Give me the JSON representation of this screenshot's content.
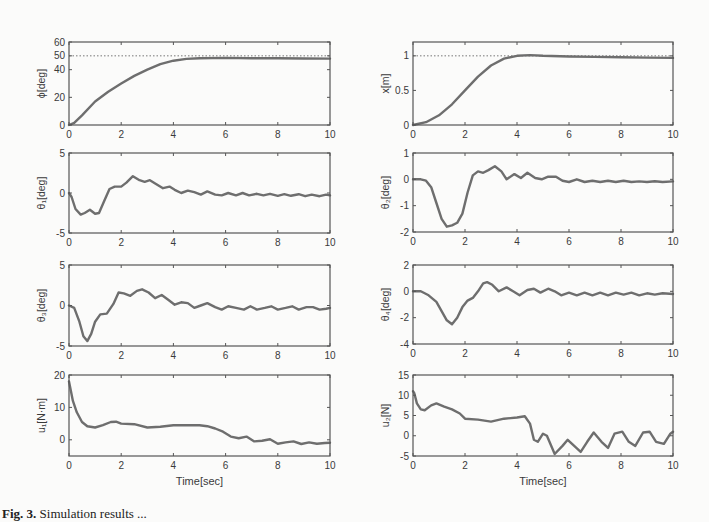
{
  "caption": {
    "label": "Fig. 3.",
    "text": "Simulation results ..."
  },
  "style": {
    "line_color": "#6e6e6e",
    "axis_color": "#555555",
    "ref_color": "#777777",
    "background": "#fbfbfa"
  },
  "chart_data": [
    {
      "id": "phi",
      "type": "line",
      "ylabel": "ϕ[deg]",
      "xlabel": "",
      "xlim": [
        0,
        10
      ],
      "ylim": [
        0,
        60
      ],
      "xticks": [
        0,
        2,
        4,
        6,
        8,
        10
      ],
      "yticks": [
        0,
        20,
        40,
        50,
        60
      ],
      "reference": 50,
      "x": [
        0,
        0.2,
        0.5,
        1,
        1.5,
        2,
        2.5,
        3,
        3.5,
        4,
        4.5,
        5,
        6,
        7,
        8,
        9,
        10
      ],
      "values": [
        0,
        1.5,
        7,
        17,
        24,
        30,
        35.5,
        40,
        44,
        46.5,
        47.8,
        48.3,
        48.5,
        48.3,
        48.2,
        48.1,
        48.0
      ]
    },
    {
      "id": "x",
      "type": "line",
      "ylabel": "x[m]",
      "xlabel": "",
      "xlim": [
        0,
        10
      ],
      "ylim": [
        0,
        1.2
      ],
      "xticks": [
        0,
        2,
        4,
        6,
        8,
        10
      ],
      "yticks": [
        0,
        0.5,
        1
      ],
      "reference": 1,
      "x": [
        0,
        0.5,
        1,
        1.5,
        2,
        2.5,
        3,
        3.5,
        4,
        4.5,
        5,
        6,
        7,
        8,
        9,
        10
      ],
      "values": [
        0,
        0.04,
        0.14,
        0.3,
        0.5,
        0.7,
        0.86,
        0.96,
        1.0,
        1.01,
        1.0,
        0.99,
        0.985,
        0.98,
        0.975,
        0.97
      ]
    },
    {
      "id": "theta1",
      "type": "line",
      "ylabel": "θ₁[deg]",
      "xlabel": "",
      "xlim": [
        0,
        10
      ],
      "ylim": [
        -5,
        5
      ],
      "xticks": [
        0,
        2,
        4,
        6,
        8,
        10
      ],
      "yticks": [
        -5,
        0,
        5
      ],
      "x": [
        0,
        0.1,
        0.25,
        0.45,
        0.6,
        0.8,
        1.0,
        1.15,
        1.35,
        1.55,
        1.75,
        2.0,
        2.2,
        2.45,
        2.7,
        2.9,
        3.1,
        3.35,
        3.6,
        3.85,
        4.05,
        4.3,
        4.55,
        4.8,
        5.05,
        5.3,
        5.6,
        5.85,
        6.1,
        6.4,
        6.65,
        6.9,
        7.2,
        7.45,
        7.7,
        8.0,
        8.25,
        8.5,
        8.8,
        9.05,
        9.3,
        9.6,
        9.85,
        10
      ],
      "values": [
        0,
        -0.5,
        -2.0,
        -2.7,
        -2.5,
        -2.1,
        -2.6,
        -2.5,
        -1.0,
        0.5,
        0.8,
        0.8,
        1.3,
        2.1,
        1.6,
        1.4,
        1.6,
        1.1,
        0.6,
        0.8,
        0.4,
        0.0,
        0.3,
        0.1,
        -0.2,
        0.2,
        -0.2,
        -0.3,
        0.0,
        -0.3,
        0.0,
        -0.3,
        -0.1,
        -0.3,
        -0.1,
        -0.35,
        -0.15,
        -0.35,
        -0.15,
        -0.4,
        -0.2,
        -0.4,
        -0.2,
        -0.3
      ]
    },
    {
      "id": "theta2",
      "type": "line",
      "ylabel": "θ₂[deg]",
      "xlabel": "",
      "xlim": [
        0,
        10
      ],
      "ylim": [
        -2,
        1
      ],
      "xticks": [
        0,
        2,
        4,
        6,
        8,
        10
      ],
      "yticks": [
        -2,
        -1,
        0,
        1
      ],
      "x": [
        0,
        0.3,
        0.5,
        0.7,
        0.9,
        1.1,
        1.3,
        1.5,
        1.7,
        1.9,
        2.1,
        2.3,
        2.5,
        2.7,
        2.9,
        3.15,
        3.4,
        3.6,
        3.9,
        4.15,
        4.4,
        4.7,
        4.95,
        5.2,
        5.5,
        5.75,
        6.0,
        6.3,
        6.6,
        6.9,
        7.2,
        7.5,
        7.8,
        8.1,
        8.4,
        8.7,
        9.0,
        9.3,
        9.6,
        10
      ],
      "values": [
        0,
        0,
        -0.05,
        -0.3,
        -0.9,
        -1.5,
        -1.8,
        -1.75,
        -1.65,
        -1.3,
        -0.5,
        0.15,
        0.3,
        0.25,
        0.35,
        0.5,
        0.3,
        0.0,
        0.2,
        0.05,
        0.25,
        0.05,
        0.0,
        0.1,
        0.1,
        -0.05,
        -0.1,
        0.0,
        -0.1,
        -0.05,
        -0.1,
        -0.05,
        -0.1,
        -0.05,
        -0.1,
        -0.08,
        -0.1,
        -0.07,
        -0.1,
        -0.08
      ]
    },
    {
      "id": "theta3",
      "type": "line",
      "ylabel": "θ₃[deg]",
      "xlabel": "",
      "xlim": [
        0,
        10
      ],
      "ylim": [
        -5,
        5
      ],
      "xticks": [
        0,
        2,
        4,
        6,
        8,
        10
      ],
      "yticks": [
        -5,
        0,
        5
      ],
      "x": [
        0,
        0.2,
        0.4,
        0.55,
        0.7,
        0.85,
        1.0,
        1.2,
        1.45,
        1.7,
        1.9,
        2.1,
        2.35,
        2.6,
        2.8,
        3.05,
        3.3,
        3.55,
        3.8,
        4.05,
        4.3,
        4.55,
        4.8,
        5.05,
        5.3,
        5.6,
        5.85,
        6.1,
        6.4,
        6.7,
        6.95,
        7.2,
        7.5,
        7.75,
        8.0,
        8.3,
        8.55,
        8.8,
        9.1,
        9.35,
        9.6,
        9.85,
        10
      ],
      "values": [
        0,
        -0.3,
        -2.0,
        -3.8,
        -4.4,
        -3.5,
        -2.0,
        -1.1,
        -1.0,
        0.2,
        1.6,
        1.5,
        1.2,
        1.8,
        2.0,
        1.6,
        0.9,
        1.3,
        0.7,
        0.1,
        0.4,
        0.3,
        -0.3,
        0.0,
        0.3,
        -0.2,
        -0.5,
        -0.1,
        -0.3,
        -0.5,
        -0.1,
        -0.5,
        -0.3,
        -0.1,
        -0.5,
        -0.3,
        -0.1,
        -0.5,
        -0.2,
        -0.2,
        -0.5,
        -0.4,
        -0.3
      ]
    },
    {
      "id": "theta4",
      "type": "line",
      "ylabel": "θ₄[deg]",
      "xlabel": "",
      "xlim": [
        0,
        10
      ],
      "ylim": [
        -4,
        2
      ],
      "xticks": [
        0,
        2,
        4,
        6,
        8,
        10
      ],
      "yticks": [
        -4,
        -2,
        0,
        2
      ],
      "x": [
        0,
        0.3,
        0.6,
        0.9,
        1.1,
        1.3,
        1.5,
        1.7,
        1.9,
        2.1,
        2.3,
        2.5,
        2.7,
        2.85,
        3.05,
        3.3,
        3.6,
        3.85,
        4.1,
        4.4,
        4.65,
        4.9,
        5.2,
        5.45,
        5.7,
        6.0,
        6.3,
        6.6,
        6.9,
        7.2,
        7.5,
        7.8,
        8.1,
        8.4,
        8.7,
        9.0,
        9.3,
        9.6,
        10
      ],
      "values": [
        0,
        0,
        -0.3,
        -0.8,
        -1.5,
        -2.2,
        -2.5,
        -2.0,
        -1.2,
        -0.7,
        -0.5,
        0.0,
        0.6,
        0.7,
        0.5,
        0.0,
        0.3,
        0.0,
        -0.3,
        0.1,
        0.2,
        -0.1,
        0.2,
        0.0,
        -0.3,
        -0.1,
        -0.3,
        -0.1,
        -0.3,
        -0.1,
        -0.3,
        -0.1,
        -0.25,
        -0.1,
        -0.3,
        -0.15,
        -0.25,
        -0.15,
        -0.2
      ]
    },
    {
      "id": "u1",
      "type": "line",
      "ylabel": "u₁[N·m]",
      "xlabel": "Time[sec]",
      "xlim": [
        0,
        10
      ],
      "ylim": [
        -5,
        20
      ],
      "xticks": [
        0,
        2,
        4,
        6,
        8,
        10
      ],
      "yticks": [
        0,
        10,
        20
      ],
      "x": [
        0,
        0.05,
        0.15,
        0.3,
        0.5,
        0.7,
        1.0,
        1.3,
        1.6,
        1.8,
        2.0,
        2.5,
        3.0,
        3.5,
        4.0,
        4.5,
        5.0,
        5.3,
        5.6,
        5.9,
        6.2,
        6.5,
        6.8,
        7.1,
        7.4,
        7.7,
        8.0,
        8.3,
        8.6,
        8.9,
        9.2,
        9.5,
        9.8,
        10
      ],
      "values": [
        18,
        16,
        12,
        8.5,
        5.5,
        4.2,
        3.8,
        4.5,
        5.5,
        5.6,
        5.0,
        4.8,
        3.8,
        4.0,
        4.5,
        4.5,
        4.5,
        4.2,
        3.5,
        2.5,
        1.0,
        0.5,
        1.0,
        -0.5,
        -0.3,
        0.2,
        -1.2,
        -0.8,
        -0.5,
        -1.3,
        -0.8,
        -1.2,
        -1.0,
        -0.9
      ]
    },
    {
      "id": "u2",
      "type": "line",
      "ylabel": "u₂[N]",
      "xlabel": "Time[sec]",
      "xlim": [
        0,
        10
      ],
      "ylim": [
        -5,
        15
      ],
      "xticks": [
        0,
        2,
        4,
        6,
        8,
        10
      ],
      "yticks": [
        -5,
        0,
        5,
        10,
        15
      ],
      "x": [
        0,
        0.05,
        0.15,
        0.3,
        0.45,
        0.7,
        0.9,
        1.2,
        1.5,
        1.8,
        2.0,
        2.5,
        3.0,
        3.5,
        4.0,
        4.3,
        4.5,
        4.65,
        4.8,
        5.0,
        5.15,
        5.45,
        5.75,
        5.95,
        6.2,
        6.45,
        6.7,
        6.95,
        7.25,
        7.5,
        7.75,
        8.05,
        8.3,
        8.55,
        8.85,
        9.1,
        9.35,
        9.65,
        9.9,
        10
      ],
      "values": [
        11,
        10.5,
        8,
        6.5,
        6.3,
        7.5,
        8.0,
        7.2,
        6.5,
        5.5,
        4.2,
        4.0,
        3.5,
        4.2,
        4.5,
        4.8,
        3.0,
        -1.0,
        -1.5,
        0.5,
        0.0,
        -4.5,
        -2.5,
        -1.0,
        -2.5,
        -4.0,
        -1.5,
        0.8,
        -1.5,
        -3.0,
        0.5,
        1.0,
        -1.5,
        -2.5,
        0.8,
        1.0,
        -1.5,
        -2.0,
        0.5,
        1.0
      ]
    }
  ]
}
